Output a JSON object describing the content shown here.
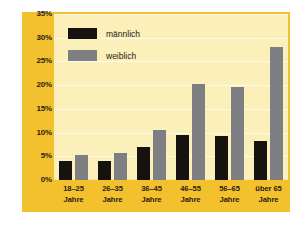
{
  "chart_data": {
    "type": "bar",
    "title": "",
    "xlabel": "",
    "ylabel": "",
    "ylim": [
      0,
      35
    ],
    "ytick_labels": [
      "35%",
      "30%",
      "25%",
      "20%",
      "15%",
      "10%",
      "5%",
      "0%"
    ],
    "ytick_values": [
      35,
      30,
      25,
      20,
      15,
      10,
      5,
      0
    ],
    "grid": true,
    "legend_position": "top-left",
    "categories": [
      "18–25 Jahre",
      "26–35 Jahre",
      "36–45 Jahre",
      "46–55 Jahre",
      "56–65 Jahre",
      "über 65 Jahre"
    ],
    "category_lines": [
      {
        "line1": "18–25",
        "line2": "Jahre"
      },
      {
        "line1": "26–35",
        "line2": "Jahre"
      },
      {
        "line1": "36–45",
        "line2": "Jahre"
      },
      {
        "line1": "46–55",
        "line2": "Jahre"
      },
      {
        "line1": "56–65",
        "line2": "Jahre"
      },
      {
        "line1": "über 65",
        "line2": "Jahre"
      }
    ],
    "series": [
      {
        "name": "männlich",
        "color": "#161210",
        "values": [
          4.0,
          4.0,
          7.0,
          9.5,
          9.3,
          8.3
        ]
      },
      {
        "name": "weiblich",
        "color": "#7e7f82",
        "values": [
          5.3,
          5.6,
          10.5,
          20.2,
          19.6,
          28.0
        ]
      }
    ]
  },
  "colors": {
    "page_background": "#ffffff",
    "frame_gold": "#f3c02e",
    "plot_background": "#fbf0b9",
    "gridline": "#fdfbe8",
    "axis_text": "#2b2212",
    "series_male": "#161210",
    "series_female": "#7e7f82"
  }
}
